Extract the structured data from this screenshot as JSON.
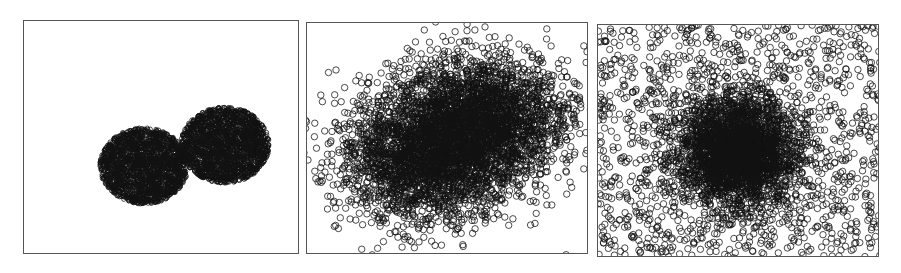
{
  "chart_data": [
    {
      "type": "scatter",
      "title": "",
      "xlabel": "",
      "ylabel": "",
      "grid": false,
      "legend": null,
      "marker": "open-circle",
      "description": "Two compact, well-separated round clusters (dense, appear solid black)",
      "panel_box": {
        "left": 23,
        "top": 20,
        "width": 276,
        "height": 234
      },
      "clusters": [
        {
          "cx": 120,
          "cy": 145,
          "rx": 44,
          "ry": 38,
          "n": 2200,
          "spread": "uniform-disk"
        },
        {
          "cx": 201,
          "cy": 124,
          "rx": 44,
          "ry": 38,
          "n": 2200,
          "spread": "uniform-disk"
        }
      ],
      "uniform_noise": 0,
      "marker_radius": 2.2
    },
    {
      "type": "scatter",
      "title": "",
      "xlabel": "",
      "ylabel": "",
      "grid": false,
      "legend": null,
      "marker": "open-circle",
      "description": "Two heavily overlapping elongated clusters forming one large blob with sparse edges",
      "panel_box": {
        "left": 306,
        "top": 22,
        "width": 282,
        "height": 232
      },
      "clusters": [
        {
          "cx": 120,
          "cy": 135,
          "rx": 80,
          "ry": 58,
          "n": 2600,
          "spread": "gaussian"
        },
        {
          "cx": 175,
          "cy": 95,
          "rx": 80,
          "ry": 58,
          "n": 2600,
          "spread": "gaussian"
        }
      ],
      "uniform_noise": 0,
      "marker_radius": 3.2
    },
    {
      "type": "scatter",
      "title": "",
      "xlabel": "",
      "ylabel": "",
      "grid": false,
      "legend": null,
      "marker": "open-circle",
      "description": "One central dense cluster surrounded by uniformly scattered background noise filling the panel",
      "panel_box": {
        "left": 597,
        "top": 24,
        "width": 282,
        "height": 233
      },
      "clusters": [
        {
          "cx": 140,
          "cy": 125,
          "rx": 55,
          "ry": 48,
          "n": 3000,
          "spread": "gaussian"
        }
      ],
      "uniform_noise": 1400,
      "marker_radius": 3.2
    }
  ]
}
